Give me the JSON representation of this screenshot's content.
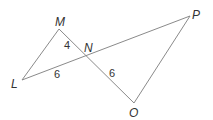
{
  "diagram": {
    "type": "geometry",
    "points": {
      "M": "M",
      "N": "N",
      "L": "L",
      "P": "P",
      "O": "O"
    },
    "segments": [
      {
        "from": "L",
        "to": "M"
      },
      {
        "from": "M",
        "to": "O"
      },
      {
        "from": "L",
        "to": "P"
      },
      {
        "from": "P",
        "to": "O"
      }
    ],
    "measurements": {
      "MN": "4",
      "LN": "6",
      "NO": "6"
    }
  }
}
